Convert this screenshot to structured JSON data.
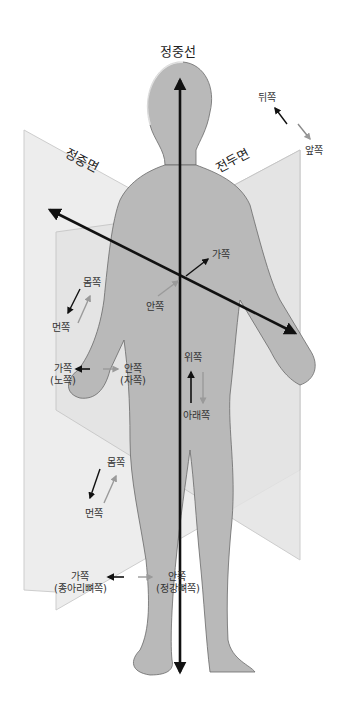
{
  "diagram": {
    "title": "정중선",
    "planes": {
      "sagittal": {
        "label": "정중면"
      },
      "frontal": {
        "label": "전두면"
      }
    },
    "axes": {
      "vertical": "정중선"
    },
    "labels": {
      "posterior": "뒤쪽",
      "anterior": "앞쪽",
      "lateral_shoulder": "가쪽",
      "medial_chest": "안쪽",
      "proximal_arm": "몸쪽",
      "distal_arm": "먼쪽",
      "lateral_forearm": "가쪽",
      "lateral_forearm_sub": "(노쪽)",
      "medial_forearm": "안쪽",
      "medial_forearm_sub": "(자쪽)",
      "superior": "위쪽",
      "inferior": "아래쪽",
      "proximal_leg": "몸쪽",
      "distal_leg": "먼쪽",
      "lateral_leg": "가쪽",
      "lateral_leg_sub": "(종아리뼈쪽)",
      "medial_leg": "안쪽",
      "medial_leg_sub": "(정강뼈쪽)"
    },
    "colors": {
      "plane_fill": "#e6e6e6",
      "plane_edge": "#c4c4c4",
      "body_fill": "#b8b8b8",
      "arrow_dark": "#111111",
      "arrow_light": "#9a9a9a"
    }
  }
}
